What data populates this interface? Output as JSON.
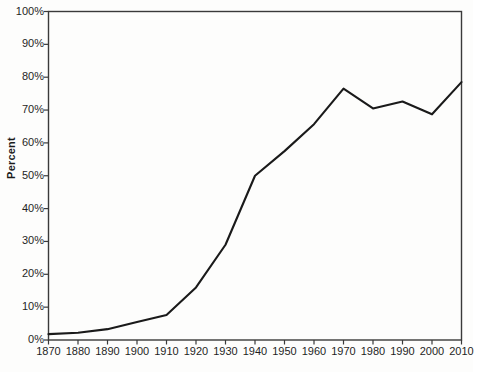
{
  "chart_data": {
    "type": "line",
    "title": "",
    "subtitle": "",
    "xlabel": "",
    "ylabel": "Percent",
    "grid": false,
    "legend": null,
    "legend_position": "none",
    "xlim": [
      1870,
      2010
    ],
    "ylim": [
      0,
      100
    ],
    "x": [
      1870,
      1880,
      1890,
      1900,
      1910,
      1920,
      1930,
      1940,
      1950,
      1960,
      1970,
      1980,
      1990,
      2000,
      2010
    ],
    "xtick_labels": [
      "1870",
      "1880",
      "1890",
      "1900",
      "1910",
      "1920",
      "1930",
      "1940",
      "1950",
      "1960",
      "1970",
      "1980",
      "1990",
      "2000",
      "2010"
    ],
    "ytick_labels": [
      "100%",
      "90%",
      "80%",
      "70%",
      "60%",
      "50%",
      "40%",
      "30%",
      "20%",
      "10%",
      "0%"
    ],
    "ytick_values": [
      100,
      90,
      80,
      70,
      60,
      50,
      40,
      30,
      20,
      10,
      0
    ],
    "series": [
      {
        "name": "Percent",
        "color": "#1a1a1a",
        "values": [
          1.8,
          2.2,
          3.3,
          5.5,
          7.6,
          16.0,
          29.0,
          50.0,
          57.5,
          65.7,
          76.5,
          70.5,
          72.6,
          68.7,
          78.5
        ]
      }
    ],
    "annotations": []
  },
  "style": {
    "line_color": "#1a1a1a",
    "axis_color": "#3a3a3a",
    "text_color": "#1f1f1f",
    "background": "#fdfdfc"
  }
}
